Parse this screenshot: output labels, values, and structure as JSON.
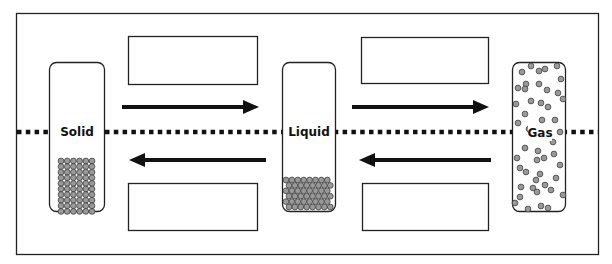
{
  "diagram": {
    "title": "",
    "states": [
      {
        "id": "solid",
        "label": "Solid"
      },
      {
        "id": "liquid",
        "label": "Liquid"
      },
      {
        "id": "gas",
        "label": "Gas"
      }
    ],
    "answer_boxes": [
      {
        "position": "top-left",
        "text": ""
      },
      {
        "position": "bottom-left",
        "text": ""
      },
      {
        "position": "top-right",
        "text": ""
      },
      {
        "position": "bottom-right",
        "text": ""
      }
    ],
    "arrows": [
      {
        "from": "solid",
        "to": "liquid",
        "direction": "right"
      },
      {
        "from": "liquid",
        "to": "solid",
        "direction": "left"
      },
      {
        "from": "liquid",
        "to": "gas",
        "direction": "right"
      },
      {
        "from": "gas",
        "to": "liquid",
        "direction": "left"
      }
    ],
    "colors": {
      "particle": "#999999",
      "stroke": "#111111"
    }
  }
}
